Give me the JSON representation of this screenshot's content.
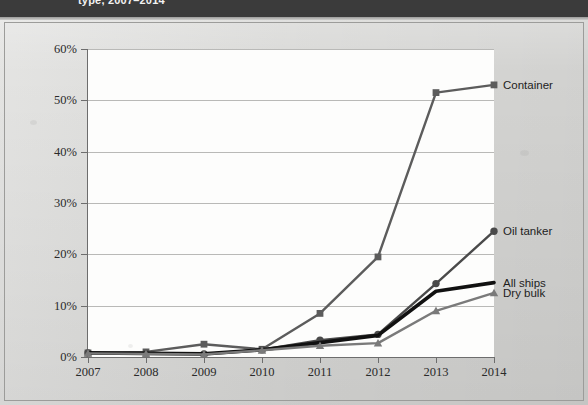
{
  "header": {
    "title": "type, 2007–2014"
  },
  "chart_data": {
    "type": "line",
    "title": "type, 2007–2014",
    "xlabel": "",
    "ylabel": "",
    "categories": [
      "2007",
      "2008",
      "2009",
      "2010",
      "2011",
      "2012",
      "2013",
      "2014"
    ],
    "x": [
      2007,
      2008,
      2009,
      2010,
      2011,
      2012,
      2013,
      2014
    ],
    "ylim": [
      0,
      60
    ],
    "yticks": [
      0,
      10,
      20,
      30,
      40,
      50,
      60
    ],
    "ytick_labels": [
      "0%",
      "10%",
      "20%",
      "30%",
      "40%",
      "50%",
      "60%"
    ],
    "grid": true,
    "legend_position": "right-inline",
    "series": [
      {
        "name": "Container",
        "marker": "square",
        "color": "#5c5c5c",
        "values": [
          0.8,
          1.0,
          2.5,
          1.5,
          8.5,
          19.5,
          51.5,
          53.0
        ]
      },
      {
        "name": "Oil tanker",
        "marker": "circle",
        "color": "#4a4a4a",
        "values": [
          0.8,
          0.7,
          0.6,
          1.4,
          3.3,
          4.4,
          14.3,
          24.5
        ]
      },
      {
        "name": "All ships",
        "marker": "none",
        "color": "#111111",
        "values": [
          0.8,
          0.7,
          0.6,
          1.4,
          2.8,
          4.2,
          12.8,
          14.5
        ]
      },
      {
        "name": "Dry bulk",
        "marker": "triangle",
        "color": "#7a7a7a",
        "values": [
          0.7,
          0.6,
          0.5,
          1.3,
          2.2,
          2.7,
          9.0,
          12.5
        ]
      }
    ]
  }
}
